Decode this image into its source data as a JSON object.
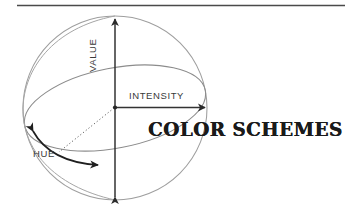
{
  "page": {
    "background_color": "#ffffff",
    "ink_color": "#2b2b2b",
    "light_line_color": "#9a9a9a",
    "width": 348,
    "height": 219
  },
  "rule": {
    "name": "top-horizontal-rule",
    "color": "#4a4a4a"
  },
  "title": {
    "text": "COLOR SCHEMES",
    "color": "#1a1a1a"
  },
  "diagram": {
    "type": "color-sphere-axes",
    "sphere": {
      "center_x": 115,
      "center_y": 108,
      "radius": 92
    },
    "axes": [
      {
        "id": "value",
        "label": "VALUE",
        "orientation": "vertical",
        "arrow": "double",
        "label_rotation_deg": -90
      },
      {
        "id": "intensity",
        "label": "INTENSITY",
        "orientation": "horizontal-right",
        "arrow": "single",
        "label_rotation_deg": 0
      },
      {
        "id": "hue",
        "label": "HUE",
        "orientation": "curved-equator",
        "arrow": "double",
        "label_rotation_deg": 0
      }
    ],
    "equator": {
      "label": "equator-ellipse",
      "tilt_deg": -12
    },
    "radius_guide": {
      "label": "dotted-radius-to-hue-arc",
      "style": "dotted"
    }
  }
}
